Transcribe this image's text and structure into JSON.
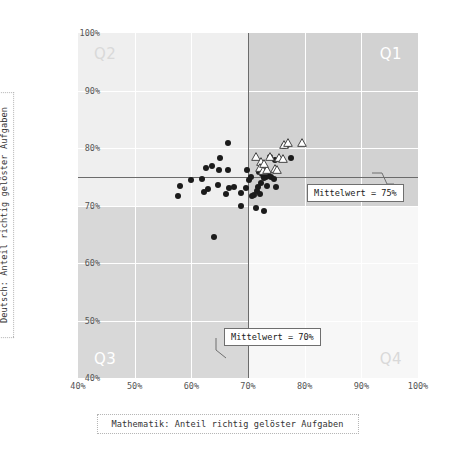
{
  "axes": {
    "x_title": "Mathematik: Anteil richtig gelöster Aufgaben",
    "y_title": "Deutsch: Anteil richtig gelöster Aufgaben",
    "x_ticks": [
      "40%",
      "50%",
      "60%",
      "70%",
      "80%",
      "90%",
      "100%"
    ],
    "y_ticks": [
      "40%",
      "50%",
      "60%",
      "70%",
      "80%",
      "90%",
      "100%"
    ]
  },
  "quadrants": {
    "q1": "Q1",
    "q2": "Q2",
    "q3": "Q3",
    "q4": "Q4"
  },
  "annotations": {
    "mean_y": "Mittelwert = 75%",
    "mean_x": "Mittelwert = 70%"
  },
  "colors": {
    "q1_fill": "#d2d2d2",
    "q2_fill": "#efefef",
    "q3_fill": "#d8d8d8",
    "q4_fill": "#f7f7f7",
    "gridline": "#ffffff",
    "mean_line": "#6b6b6b",
    "circle_marker": "#1b1b1b",
    "triangle_marker_fill": "#ffffff",
    "triangle_marker_stroke": "#444444",
    "quad_label_dark": "#ffffff",
    "quad_label_light": "#d9d9d9",
    "tick_text": "#555555",
    "axis_title_text": "#333333"
  },
  "chart_data": {
    "type": "scatter",
    "title": "",
    "xlabel": "Mathematik: Anteil richtig gelöster Aufgaben",
    "ylabel": "Deutsch: Anteil richtig gelöster Aufgaben",
    "xlim": [
      40,
      100
    ],
    "ylim": [
      40,
      100
    ],
    "xticks": [
      40,
      50,
      60,
      70,
      80,
      90,
      100
    ],
    "yticks": [
      40,
      50,
      60,
      70,
      80,
      90,
      100
    ],
    "grid": true,
    "legend": "none",
    "reference_lines": [
      {
        "orientation": "vertical",
        "value": 70,
        "label": "Mittelwert = 70%"
      },
      {
        "orientation": "horizontal",
        "value": 75,
        "label": "Mittelwert = 75%"
      }
    ],
    "quadrant_labels": [
      {
        "name": "Q1",
        "position": "top-right"
      },
      {
        "name": "Q2",
        "position": "top-left"
      },
      {
        "name": "Q3",
        "position": "bottom-left"
      },
      {
        "name": "Q4",
        "position": "bottom-right"
      }
    ],
    "series": [
      {
        "name": "circles",
        "marker": "circle-filled",
        "points": [
          [
            66.5,
            80.8
          ],
          [
            65.0,
            78.3
          ],
          [
            63.7,
            76.9
          ],
          [
            64.8,
            76.2
          ],
          [
            66.5,
            76.1
          ],
          [
            69.9,
            76.2
          ],
          [
            71.9,
            75.8
          ],
          [
            72.6,
            76.0
          ],
          [
            73.2,
            75.7
          ],
          [
            72.9,
            75.2
          ],
          [
            73.3,
            75.1
          ],
          [
            73.6,
            75.3
          ],
          [
            73.1,
            74.9
          ],
          [
            72.8,
            74.7
          ],
          [
            72.5,
            75.4
          ],
          [
            73.9,
            78.4
          ],
          [
            74.8,
            78.0
          ],
          [
            77.5,
            78.3
          ],
          [
            76.9,
            80.6
          ],
          [
            76.4,
            80.4
          ],
          [
            74.1,
            75.0
          ],
          [
            74.6,
            74.6
          ],
          [
            75.0,
            73.2
          ],
          [
            72.3,
            73.9
          ],
          [
            71.8,
            73.3
          ],
          [
            71.5,
            72.6
          ],
          [
            72.1,
            72.0
          ],
          [
            73.4,
            73.4
          ],
          [
            70.6,
            74.9
          ],
          [
            70.2,
            74.4
          ],
          [
            69.6,
            73.1
          ],
          [
            68.8,
            72.1
          ],
          [
            67.6,
            73.3
          ],
          [
            66.6,
            73.0
          ],
          [
            66.2,
            72.0
          ],
          [
            64.7,
            73.5
          ],
          [
            63.0,
            72.9
          ],
          [
            62.3,
            72.3
          ],
          [
            61.9,
            74.6
          ],
          [
            62.6,
            76.5
          ],
          [
            60.0,
            74.4
          ],
          [
            58.0,
            73.4
          ],
          [
            57.7,
            71.7
          ],
          [
            64.0,
            64.6
          ],
          [
            68.8,
            69.9
          ],
          [
            71.4,
            69.6
          ],
          [
            72.9,
            69.1
          ],
          [
            71.1,
            71.9
          ],
          [
            70.7,
            71.6
          ]
        ]
      },
      {
        "name": "triangles",
        "marker": "triangle-open",
        "points": [
          [
            71.4,
            78.5
          ],
          [
            72.3,
            77.5
          ],
          [
            72.1,
            76.5
          ],
          [
            72.6,
            76.0
          ],
          [
            73.3,
            76.1
          ],
          [
            73.8,
            78.4
          ],
          [
            74.7,
            76.3
          ],
          [
            75.2,
            76.1
          ],
          [
            75.5,
            78.3
          ],
          [
            76.1,
            78.1
          ],
          [
            76.4,
            80.6
          ],
          [
            77.0,
            80.9
          ],
          [
            79.6,
            80.9
          ],
          [
            72.8,
            77.2
          ]
        ]
      }
    ]
  }
}
